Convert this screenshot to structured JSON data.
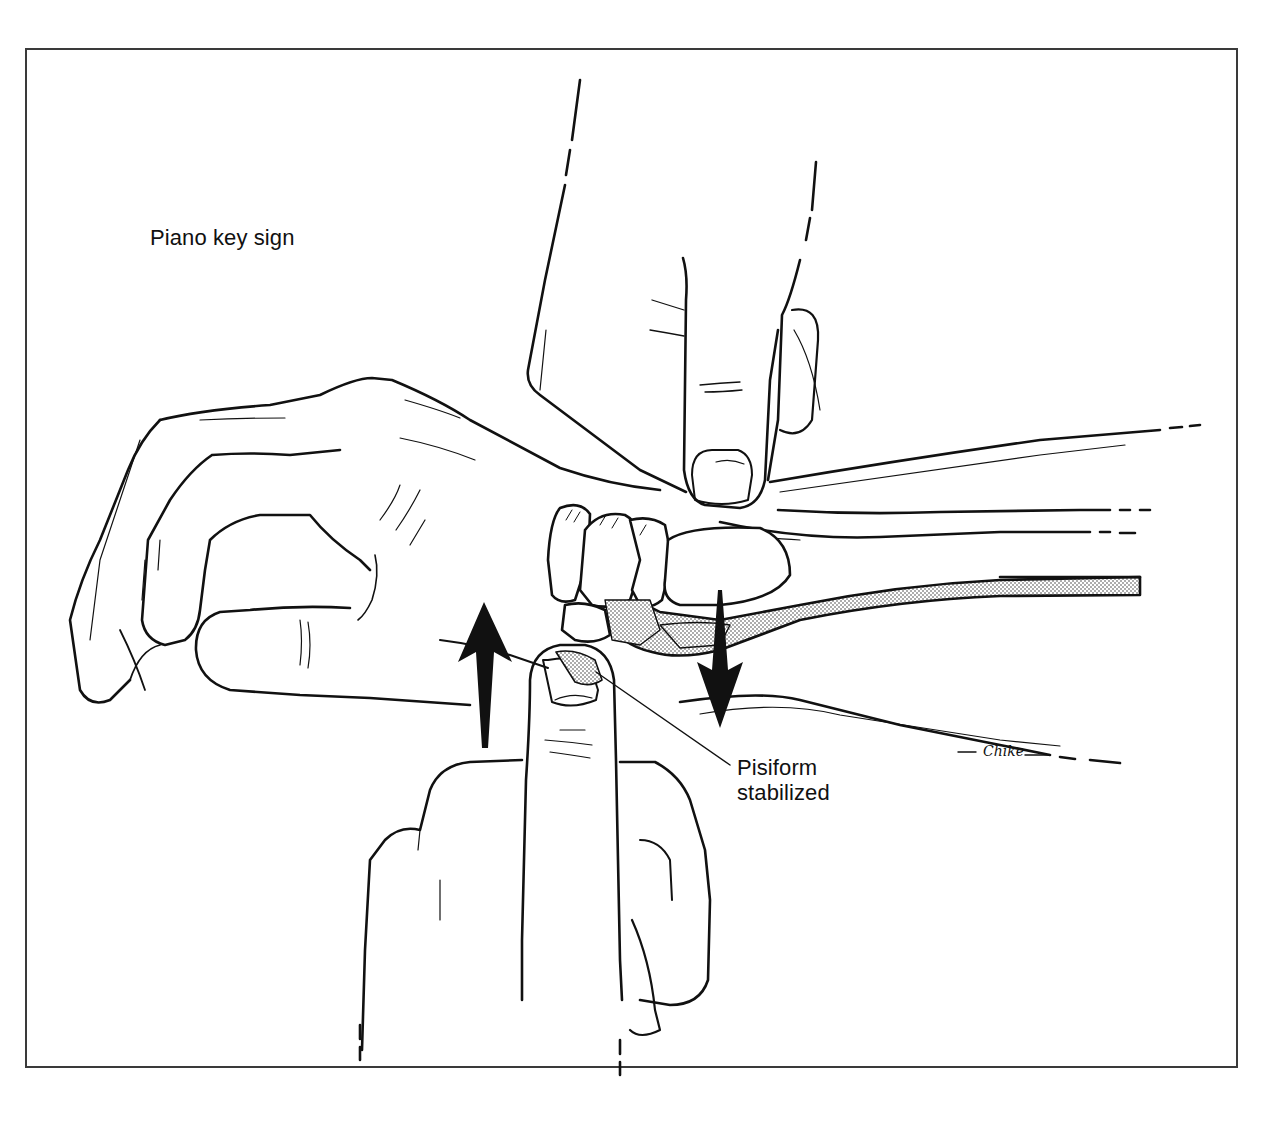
{
  "figure": {
    "title": "Piano key sign",
    "callout": {
      "line1": "Pisiform",
      "line2": "stabilized"
    },
    "signature": "Chike",
    "colors": {
      "ink": "#111111",
      "frame": "#3a3a3a",
      "background": "#ffffff",
      "stipple": "#555555"
    },
    "arrows": [
      {
        "name": "up-arrow",
        "direction": "up"
      },
      {
        "name": "down-arrow",
        "direction": "down"
      }
    ],
    "elements": [
      "examiner-upper-hand-pressing-distal-radius",
      "patient-hand-and-forearm",
      "carpal-bones",
      "ulna-stippled",
      "examiner-lower-thumb-on-pisiform"
    ]
  }
}
